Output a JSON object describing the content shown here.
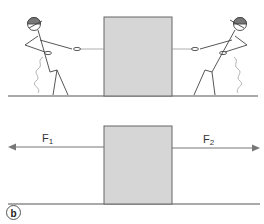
{
  "figure": {
    "panel_label": "b",
    "top_scene": {
      "description": "Two people pulling ropes attached to a box in opposite directions",
      "box_color": "#d6d6d6",
      "box_border": "#666666",
      "left_person": "stick-figure-pulling-left",
      "right_person": "stick-figure-pulling-right"
    },
    "free_body": {
      "box_color": "#d6d6d6",
      "forces": [
        {
          "name": "F",
          "sub": "1",
          "direction": "left"
        },
        {
          "name": "F",
          "sub": "2",
          "direction": "right"
        }
      ]
    }
  }
}
